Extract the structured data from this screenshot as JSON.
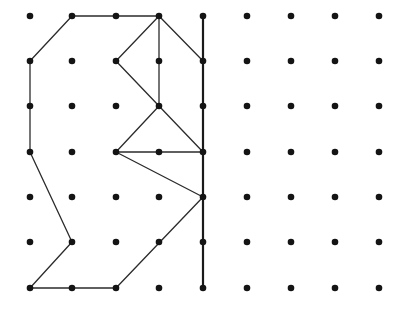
{
  "diagram": {
    "type": "dot-grid-reflection",
    "grid": {
      "columns": 9,
      "rows": 7,
      "x_positions": [
        30,
        72,
        116,
        159,
        203,
        247,
        291,
        335,
        379
      ],
      "y_positions": [
        16,
        61,
        106,
        152,
        197,
        242,
        288
      ],
      "dot_radius": 3.3,
      "dot_color": "#141414"
    },
    "mirror_line": {
      "from": [
        4,
        0
      ],
      "to": [
        4,
        6
      ],
      "color": "#1a1a1a"
    },
    "shape_segments": [
      [
        [
          1,
          0
        ],
        [
          3,
          0
        ]
      ],
      [
        [
          1,
          0
        ],
        [
          0,
          1
        ]
      ],
      [
        [
          0,
          1
        ],
        [
          0,
          3
        ]
      ],
      [
        [
          0,
          3
        ],
        [
          1,
          5
        ]
      ],
      [
        [
          1,
          5
        ],
        [
          0,
          6
        ]
      ],
      [
        [
          0,
          6
        ],
        [
          2,
          6
        ]
      ],
      [
        [
          2,
          6
        ],
        [
          4,
          4
        ]
      ],
      [
        [
          3,
          0
        ],
        [
          2,
          1
        ]
      ],
      [
        [
          2,
          1
        ],
        [
          3,
          2
        ]
      ],
      [
        [
          3,
          0
        ],
        [
          3,
          2
        ]
      ],
      [
        [
          3,
          0
        ],
        [
          4,
          1
        ]
      ],
      [
        [
          3,
          2
        ],
        [
          2,
          3
        ]
      ],
      [
        [
          3,
          2
        ],
        [
          4,
          3
        ]
      ],
      [
        [
          2,
          3
        ],
        [
          4,
          3
        ]
      ],
      [
        [
          2,
          3
        ],
        [
          4,
          4
        ]
      ]
    ],
    "line_color": "#2b2b2b"
  }
}
